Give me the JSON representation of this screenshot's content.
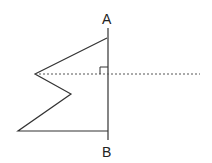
{
  "figure": {
    "labels": {
      "top": "A",
      "bottom": "B"
    },
    "colors": {
      "line": "#333333",
      "dashed": "#555555",
      "background": "#ffffff"
    },
    "elements": [
      "polygon with zigzag left side",
      "vertical line AB",
      "dashed horizontal perpendicular line",
      "right-angle marker"
    ]
  }
}
